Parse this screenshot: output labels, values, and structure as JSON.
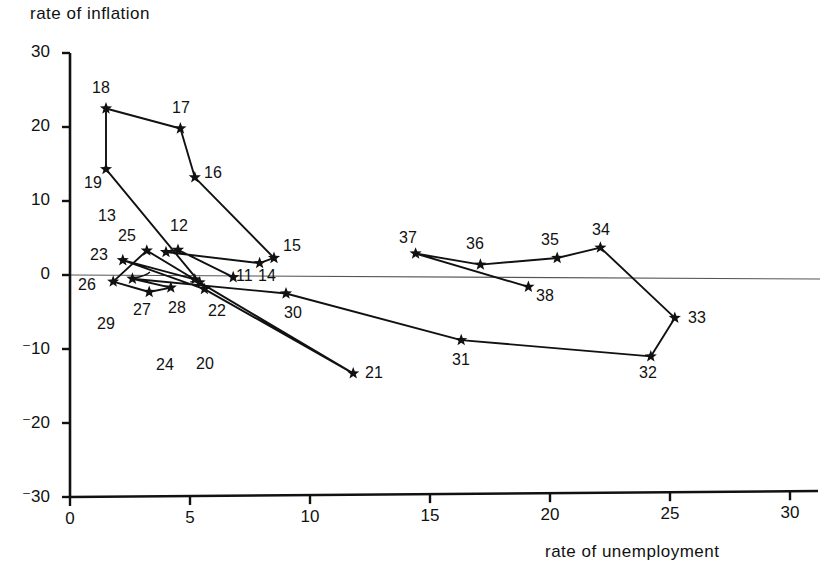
{
  "figure": {
    "background": "#ffffff",
    "ink_color": "#111111",
    "zero_line_color": "#555555"
  },
  "chart_data": {
    "type": "scatter",
    "title": "",
    "subtitle": "",
    "xlabel": "rate of unemployment",
    "ylabel": "rate of inflation",
    "xlim": [
      0,
      31
    ],
    "ylim": [
      -30,
      30
    ],
    "xticks": [
      "0",
      "5",
      "10",
      "15",
      "20",
      "25",
      "30"
    ],
    "xtick_values": [
      0,
      5,
      10,
      15,
      20,
      25,
      30
    ],
    "yticks": [
      "30",
      "20",
      "10",
      "0",
      "-10",
      "-20",
      "-30"
    ],
    "ytick_values": [
      30,
      20,
      10,
      0,
      -10,
      -20,
      -30
    ],
    "grid": false,
    "legend": "none",
    "marker": "star",
    "zero_reference_line": 0,
    "annotations": [
      "Connected trajectory of yearly observations labelled 11 through 38"
    ],
    "points": [
      {
        "label": "11",
        "x": 6.8,
        "y": -0.3,
        "lx": 236,
        "ly": 268
      },
      {
        "label": "12",
        "x": 4.5,
        "y": 3.4,
        "lx": 170,
        "ly": 218
      },
      {
        "label": "13",
        "x": 4.0,
        "y": 3.1,
        "lx": 98,
        "ly": 208
      },
      {
        "label": "14",
        "x": 7.9,
        "y": 1.6,
        "lx": 258,
        "ly": 268
      },
      {
        "label": "15",
        "x": 8.5,
        "y": 2.3,
        "lx": 283,
        "ly": 238
      },
      {
        "label": "16",
        "x": 5.2,
        "y": 13.2,
        "lx": 204,
        "ly": 165
      },
      {
        "label": "17",
        "x": 4.6,
        "y": 19.8,
        "lx": 172,
        "ly": 100
      },
      {
        "label": "18",
        "x": 1.5,
        "y": 22.5,
        "lx": 92,
        "ly": 80
      },
      {
        "label": "19",
        "x": 1.5,
        "y": 14.3,
        "lx": 84,
        "ly": 175
      },
      {
        "label": "20",
        "x": 5.4,
        "y": -1.0,
        "lx": 196,
        "ly": 356
      },
      {
        "label": "21",
        "x": 11.8,
        "y": -13.3,
        "lx": 365,
        "ly": 365
      },
      {
        "label": "22",
        "x": 5.6,
        "y": -1.9,
        "lx": 208,
        "ly": 303
      },
      {
        "label": "23",
        "x": 2.2,
        "y": 2.0,
        "lx": 90,
        "ly": 247
      },
      {
        "label": "24",
        "x": 5.2,
        "y": -0.6,
        "lx": 156,
        "ly": 357
      },
      {
        "label": "25",
        "x": 3.2,
        "y": 3.3,
        "lx": 118,
        "ly": 228
      },
      {
        "label": "26",
        "x": 1.8,
        "y": -0.9,
        "lx": 78,
        "ly": 277
      },
      {
        "label": "27",
        "x": 3.3,
        "y": -2.3,
        "lx": 133,
        "ly": 302
      },
      {
        "label": "28",
        "x": 4.2,
        "y": -1.7,
        "lx": 168,
        "ly": 300
      },
      {
        "label": "29",
        "x": 2.6,
        "y": -0.5,
        "lx": 97,
        "ly": 316
      },
      {
        "label": "30",
        "x": 9.0,
        "y": -2.5,
        "lx": 284,
        "ly": 305
      },
      {
        "label": "31",
        "x": 16.3,
        "y": -8.8,
        "lx": 452,
        "ly": 352
      },
      {
        "label": "32",
        "x": 24.2,
        "y": -11.0,
        "lx": 639,
        "ly": 365
      },
      {
        "label": "33",
        "x": 25.2,
        "y": -5.8,
        "lx": 688,
        "ly": 310
      },
      {
        "label": "34",
        "x": 22.1,
        "y": 3.7,
        "lx": 592,
        "ly": 222
      },
      {
        "label": "35",
        "x": 20.3,
        "y": 2.3,
        "lx": 541,
        "ly": 232
      },
      {
        "label": "36",
        "x": 17.1,
        "y": 1.4,
        "lx": 466,
        "ly": 236
      },
      {
        "label": "37",
        "x": 14.4,
        "y": 2.9,
        "lx": 399,
        "ly": 230
      },
      {
        "label": "38",
        "x": 19.1,
        "y": -1.6,
        "lx": 536,
        "ly": 288
      }
    ],
    "path_order": [
      "11",
      "12",
      "13",
      "14",
      "15",
      "16",
      "17",
      "18",
      "19",
      "20",
      "21",
      "22",
      "23",
      "24",
      "25",
      "26",
      "27",
      "28",
      "29",
      "30",
      "31",
      "32",
      "33",
      "34",
      "35",
      "36",
      "37",
      "38"
    ],
    "leader_lines": [
      {
        "from": "13",
        "to_x": 170,
        "to_y": 250
      },
      {
        "from": "20",
        "to_x": 196,
        "to_y": 285
      },
      {
        "from": "24",
        "to_x": 190,
        "to_y": 282
      },
      {
        "from": "29",
        "to_x": 150,
        "to_y": 272
      }
    ]
  }
}
